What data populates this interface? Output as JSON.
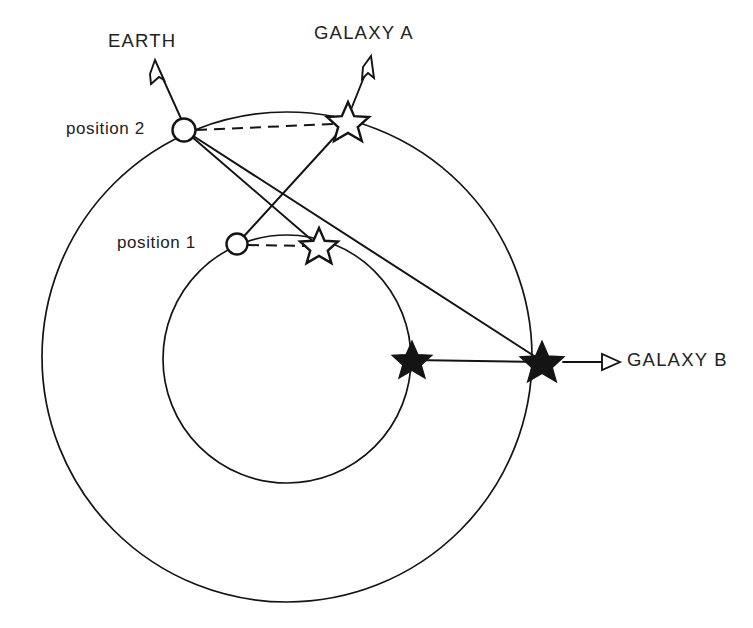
{
  "figure": {
    "width": 753,
    "height": 628,
    "background_color": "#ffffff",
    "ink_color": "#141414"
  },
  "labels": {
    "earth": "EARTH",
    "galaxy_a": "GALAXY A",
    "galaxy_b": "GALAXY B",
    "position_1": "position 1",
    "position_2": "position 2"
  },
  "geometry": {
    "outer_orbit": {
      "cx": 287,
      "cy": 357,
      "r": 245,
      "name": "outer-orbit-circle"
    },
    "inner_orbit": {
      "cx": 287,
      "cy": 359,
      "r": 124,
      "name": "inner-orbit-circle"
    },
    "observer_positions": [
      {
        "id": "position-2",
        "cx": 184,
        "cy": 130,
        "r": 11,
        "orbit": "outer"
      },
      {
        "id": "position-1",
        "cx": 237,
        "cy": 244,
        "r": 10,
        "orbit": "inner"
      }
    ],
    "open_stars": [
      {
        "id": "apparent-galaxy-a-from-position-2",
        "cx": 348,
        "cy": 122,
        "r": 20
      },
      {
        "id": "apparent-galaxy-a-from-position-1",
        "cx": 319,
        "cy": 246,
        "r": 18
      }
    ],
    "filled_stars": [
      {
        "id": "galaxy-b-inner-marker",
        "cx": 412,
        "cy": 360,
        "r": 19
      },
      {
        "id": "galaxy-b-outer-marker",
        "cx": 542,
        "cy": 362,
        "r": 21
      }
    ],
    "sight_lines": [
      {
        "id": "position-2-to-star-a-near",
        "x1": 184,
        "y1": 130,
        "x2": 319,
        "y2": 246
      },
      {
        "id": "position-2-to-galaxy-b",
        "x1": 184,
        "y1": 130,
        "x2": 542,
        "y2": 362
      },
      {
        "id": "position-1-to-star-a-far",
        "x1": 237,
        "y1": 244,
        "x2": 348,
        "y2": 122
      },
      {
        "id": "galaxy-b-inner-to-outer",
        "x1": 412,
        "y1": 360,
        "x2": 542,
        "y2": 362
      }
    ],
    "dashed_lines": [
      {
        "id": "apparent-direction-position-2",
        "x1": 195,
        "y1": 130,
        "x2": 330,
        "y2": 124
      },
      {
        "id": "apparent-direction-position-1",
        "x1": 247,
        "y1": 244,
        "x2": 304,
        "y2": 246
      }
    ],
    "arrows": [
      {
        "id": "earth-arrow",
        "x1": 184,
        "y1": 130,
        "x2": 155,
        "y2": 62,
        "label": "EARTH"
      },
      {
        "id": "galaxy-a-arrow",
        "x1": 348,
        "y1": 122,
        "x2": 365,
        "y2": 56,
        "label": "GALAXY A"
      },
      {
        "id": "galaxy-b-arrow",
        "x1": 562,
        "y1": 362,
        "x2": 617,
        "y2": 362,
        "label": "GALAXY B"
      }
    ]
  }
}
